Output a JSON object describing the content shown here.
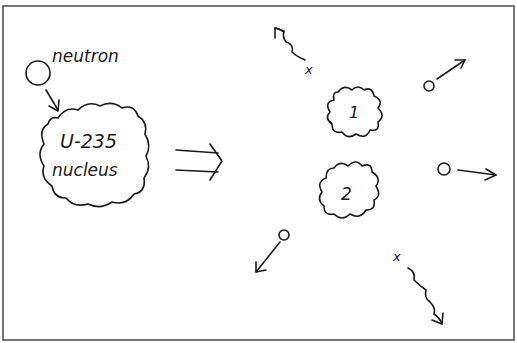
{
  "diagram": {
    "colors": {
      "ink": "#1a1a1a",
      "frame": "#555555",
      "background": "#ffffff"
    },
    "before": {
      "neutron_label": "neutron",
      "nucleus_label_line1": "U-235",
      "nucleus_label_line2": "nucleus"
    },
    "transition_arrow": "double-arrow (implies)",
    "after": {
      "fragments": [
        {
          "label": "1"
        },
        {
          "label": "2"
        }
      ],
      "neutrons_emitted": 3,
      "gamma_rays": [
        {
          "label": "x"
        },
        {
          "label": "x"
        }
      ]
    }
  }
}
